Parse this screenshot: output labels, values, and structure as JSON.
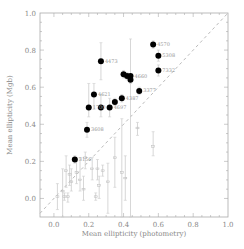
{
  "chart_data": {
    "type": "scatter",
    "title": "",
    "xlabel": "Mean ellipticity (photometry)",
    "ylabel": "Mean ellipticity (Mgb)",
    "xlim": [
      -0.08,
      1.0
    ],
    "ylim": [
      -0.1,
      1.0
    ],
    "xticks": [
      "0.0",
      "0.2",
      "0.4",
      "0.6",
      "0.8",
      "1.0"
    ],
    "yticks": [
      "0.0",
      "0.2",
      "0.4",
      "0.6",
      "0.8",
      "1.0"
    ],
    "xtick_values": [
      0.0,
      0.2,
      0.4,
      0.6,
      0.8,
      1.0
    ],
    "ytick_values": [
      0.0,
      0.2,
      0.4,
      0.6,
      0.8,
      1.0
    ],
    "grid": false,
    "reference_line": {
      "type": "one-to-one",
      "style": "dashed"
    },
    "series": [
      {
        "name": "labelled",
        "marker": "filled-circle",
        "points": [
          {
            "x": 0.27,
            "y": 0.74,
            "ylo": 0.64,
            "yhi": 0.84,
            "label": "4473"
          },
          {
            "x": 0.57,
            "y": 0.83,
            "ylo": 0.81,
            "yhi": 0.85,
            "label": "4570"
          },
          {
            "x": 0.6,
            "y": 0.77,
            "ylo": 0.74,
            "yhi": 0.8,
            "label": "5308"
          },
          {
            "x": 0.6,
            "y": 0.69,
            "ylo": 0.66,
            "yhi": 0.72,
            "label": "7332"
          },
          {
            "x": 0.49,
            "y": 0.58,
            "ylo": 0.56,
            "yhi": 0.6,
            "label": "3377"
          },
          {
            "x": 0.4,
            "y": 0.67,
            "ylo": 0.65,
            "yhi": 0.69,
            "label": ""
          },
          {
            "x": 0.42,
            "y": 0.66,
            "ylo": 0.64,
            "yhi": 0.68,
            "label": ""
          },
          {
            "x": 0.44,
            "y": 0.66,
            "ylo": -0.1,
            "yhi": 0.86,
            "label": "4660"
          },
          {
            "x": 0.44,
            "y": 0.64,
            "ylo": 0.62,
            "yhi": 0.66,
            "label": ""
          },
          {
            "x": 0.23,
            "y": 0.56,
            "ylo": 0.48,
            "yhi": 0.62,
            "label": "4621"
          },
          {
            "x": 0.2,
            "y": 0.49,
            "ylo": 0.44,
            "yhi": 0.62,
            "label": "1700"
          },
          {
            "x": 0.27,
            "y": 0.49,
            "ylo": 0.44,
            "yhi": 0.56,
            "label": ""
          },
          {
            "x": 0.32,
            "y": 0.49,
            "ylo": 0.44,
            "yhi": 0.54,
            "label": "4697"
          },
          {
            "x": 0.35,
            "y": 0.52,
            "ylo": 0.5,
            "yhi": 0.54,
            "label": ""
          },
          {
            "x": 0.39,
            "y": 0.54,
            "ylo": 0.52,
            "yhi": 0.56,
            "label": "4387"
          },
          {
            "x": 0.19,
            "y": 0.37,
            "ylo": 0.33,
            "yhi": 0.41,
            "label": "3608"
          },
          {
            "x": 0.12,
            "y": 0.21,
            "ylo": 0.19,
            "yhi": 0.23,
            "label": "3156"
          }
        ]
      },
      {
        "name": "unlabelled",
        "marker": "small-open",
        "points": [
          {
            "x": 0.02,
            "y": 0.01,
            "ylo": -0.06,
            "yhi": 0.08
          },
          {
            "x": 0.05,
            "y": 0.04,
            "ylo": -0.1,
            "yhi": 0.16
          },
          {
            "x": 0.06,
            "y": 0.01,
            "ylo": -0.01,
            "yhi": 0.03
          },
          {
            "x": 0.07,
            "y": 0.15,
            "ylo": 0.06,
            "yhi": 0.23
          },
          {
            "x": 0.08,
            "y": 0.01,
            "ylo": -0.02,
            "yhi": 0.03
          },
          {
            "x": 0.09,
            "y": 0.13,
            "ylo": 0.07,
            "yhi": 0.18
          },
          {
            "x": 0.1,
            "y": 0.09,
            "ylo": 0.04,
            "yhi": 0.16
          },
          {
            "x": 0.13,
            "y": 0.14,
            "ylo": 0.08,
            "yhi": 0.2
          },
          {
            "x": 0.15,
            "y": 0.1,
            "ylo": 0.04,
            "yhi": 0.22
          },
          {
            "x": 0.17,
            "y": 0.05,
            "ylo": -0.01,
            "yhi": 0.12
          },
          {
            "x": 0.18,
            "y": 0.22,
            "ylo": 0.16,
            "yhi": 0.25
          },
          {
            "x": 0.22,
            "y": 0.16,
            "ylo": 0.1,
            "yhi": 0.22
          },
          {
            "x": 0.24,
            "y": 0.01,
            "ylo": -0.01,
            "yhi": 0.03
          },
          {
            "x": 0.25,
            "y": 0.16,
            "ylo": 0.1,
            "yhi": 0.21
          },
          {
            "x": 0.26,
            "y": 0.07,
            "ylo": 0.0,
            "yhi": 0.12
          },
          {
            "x": 0.28,
            "y": 0.15,
            "ylo": 0.12,
            "yhi": 0.18
          },
          {
            "x": 0.31,
            "y": 0.09,
            "ylo": -0.08,
            "yhi": 0.19
          },
          {
            "x": 0.35,
            "y": 0.22,
            "ylo": 0.06,
            "yhi": 0.33
          },
          {
            "x": 0.39,
            "y": 0.14,
            "ylo": -0.1,
            "yhi": 0.43
          },
          {
            "x": 0.41,
            "y": 0.11,
            "ylo": -0.01,
            "yhi": 0.23
          },
          {
            "x": 0.48,
            "y": 0.38,
            "ylo": 0.34,
            "yhi": 0.41
          },
          {
            "x": 0.57,
            "y": 0.28,
            "ylo": 0.23,
            "yhi": 0.36
          }
        ]
      }
    ]
  }
}
